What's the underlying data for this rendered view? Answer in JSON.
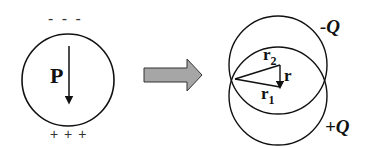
{
  "diagram": {
    "left": {
      "top_charges": "- - -",
      "bottom_charges": "+ + +",
      "polarization_label": "P"
    },
    "transition_arrow": {
      "icon": "right-arrow-icon",
      "fill": "#a6a6a6"
    },
    "right": {
      "negative_label": "-Q",
      "positive_label": "+Q",
      "r2_label": "r",
      "r2_sub": "2",
      "r1_label": "r",
      "r1_sub": "1",
      "r_label": "r"
    }
  }
}
